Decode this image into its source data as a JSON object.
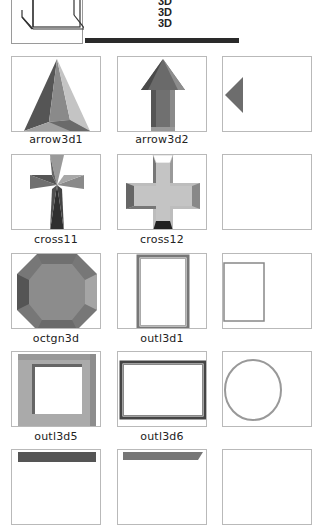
{
  "header": {
    "cube_preview_icon": "wireframe-cube-icon",
    "labels": [
      "3D",
      "3D",
      "3D"
    ]
  },
  "gallery": {
    "items": [
      {
        "name": "arrow3d1",
        "icon": "arrow-3d-1-icon"
      },
      {
        "name": "arrow3d2",
        "icon": "arrow-3d-2-icon"
      },
      {
        "name": "",
        "icon": "partial-diamond-icon"
      },
      {
        "name": "cross11",
        "icon": "cross-11-icon"
      },
      {
        "name": "cross12",
        "icon": "cross-12-icon"
      },
      {
        "name": "",
        "icon": "blank-thumbnail-icon"
      },
      {
        "name": "octgn3d",
        "icon": "octagon-3d-icon"
      },
      {
        "name": "outl3d1",
        "icon": "outline-3d-1-icon"
      },
      {
        "name": "",
        "icon": "partial-outline-icon"
      },
      {
        "name": "outl3d5",
        "icon": "outline-3d-5-icon"
      },
      {
        "name": "outl3d6",
        "icon": "outline-3d-6-icon"
      },
      {
        "name": "",
        "icon": "partial-circle-icon"
      }
    ]
  },
  "colors": {
    "frame_border": "#b9b9b9",
    "shape_dark": "#555555",
    "shape_mid": "#8a8a8a",
    "shape_light": "#b5b5b5",
    "rule": "#2a2a2a"
  }
}
